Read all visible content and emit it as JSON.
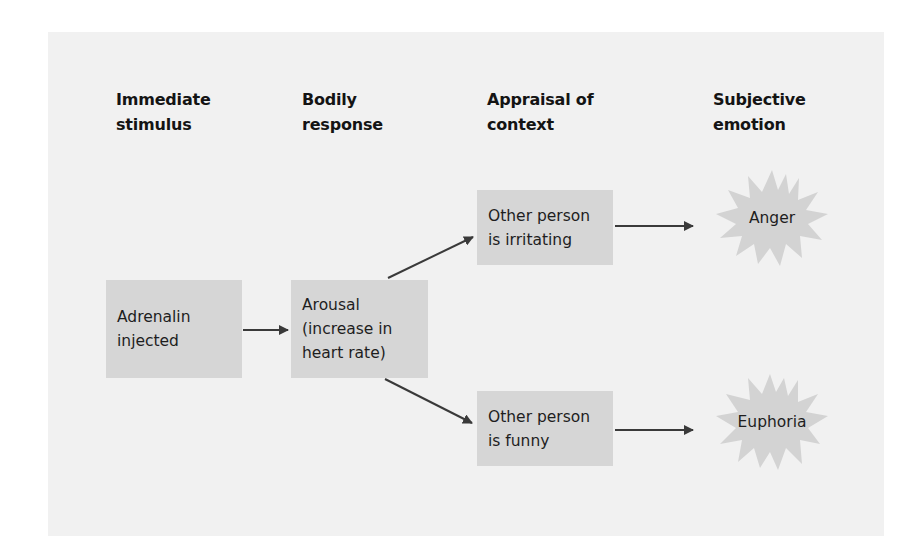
{
  "diagram": {
    "type": "flowchart",
    "columns": [
      {
        "id": "immediate",
        "line1": "Immediate",
        "line2": "stimulus"
      },
      {
        "id": "bodily",
        "line1": "Bodily",
        "line2": "response"
      },
      {
        "id": "appraisal",
        "line1": "Appraisal of",
        "line2": "context"
      },
      {
        "id": "subjective",
        "line1": "Subjective",
        "line2": "emotion"
      }
    ],
    "nodes": {
      "stimulus": {
        "lines": [
          "Adrenalin",
          "injected"
        ],
        "shape": "rectangle"
      },
      "arousal": {
        "lines": [
          "Arousal",
          "(increase in",
          "heart rate)"
        ],
        "shape": "rectangle"
      },
      "irritating": {
        "lines": [
          "Other person",
          "is irritating"
        ],
        "shape": "rectangle"
      },
      "funny": {
        "lines": [
          "Other person",
          "is funny"
        ],
        "shape": "rectangle"
      },
      "anger": {
        "label": "Anger",
        "shape": "starburst"
      },
      "euphoria": {
        "label": "Euphoria",
        "shape": "starburst"
      }
    },
    "edges": [
      {
        "from": "stimulus",
        "to": "arousal"
      },
      {
        "from": "arousal",
        "to": "irritating"
      },
      {
        "from": "arousal",
        "to": "funny"
      },
      {
        "from": "irritating",
        "to": "anger"
      },
      {
        "from": "funny",
        "to": "euphoria"
      }
    ],
    "colors": {
      "panel": "#f1f1f1",
      "box": "#d6d6d6",
      "star": "#d3d3d3",
      "arrow": "#3a3a3a",
      "text": "#1e1e1e"
    }
  }
}
